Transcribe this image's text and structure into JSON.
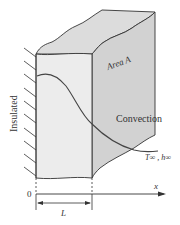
{
  "diagram": {
    "labels": {
      "insulated": "Insulated",
      "area": "Area A",
      "convection": "Convection",
      "ambient": "T∞ , h∞",
      "x_axis": "x",
      "origin": "0",
      "length": "L"
    },
    "colors": {
      "front_face": "#ececec",
      "side_face": "#d2d2d2",
      "top_face": "#dcdcdc",
      "line": "#333333"
    }
  }
}
